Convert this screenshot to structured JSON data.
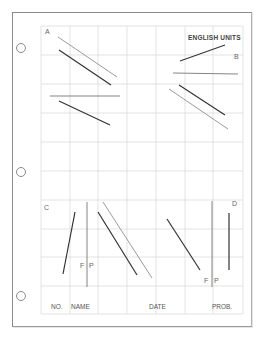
{
  "sheet": {
    "units_label": "ENGLISH UNITS",
    "problem_labels": {
      "a": "A",
      "b": "B",
      "c": "C",
      "d": "D"
    },
    "plane_labels": {
      "c_f": "F",
      "c_p": "P",
      "d_f": "F",
      "d_p": "P"
    },
    "title_block": {
      "no": "NO.",
      "name": "NAME",
      "date": "DATE",
      "prob": "PROB."
    }
  },
  "colors": {
    "grid": "#d9d9d9",
    "dark_line": "#3a3a3a",
    "light_line": "#8f8f8f",
    "border": "#8a8a8a"
  }
}
